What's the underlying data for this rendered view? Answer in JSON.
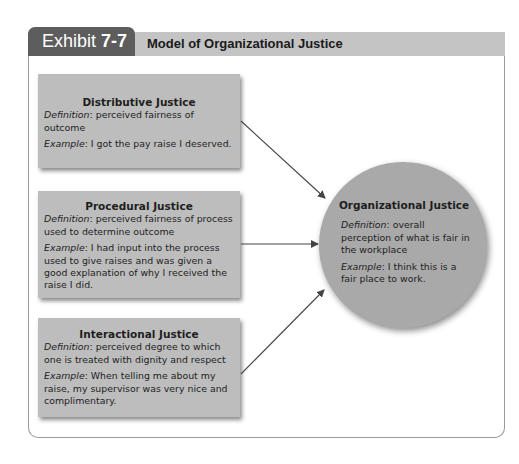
{
  "exhibit": {
    "label_prefix": "Exhibit ",
    "label_number": "7-7",
    "title": "Model of Organizational Justice"
  },
  "colors": {
    "tab": "#5d5d5d",
    "header_band": "#c4c4c4",
    "box_fill": "#bdbdbd",
    "circle_fill": "#a9a9a9",
    "arrow": "#444444"
  },
  "sources": [
    {
      "title": "Distributive Justice",
      "definition_label": "Definition",
      "definition": ": perceived fairness of outcome",
      "example_label": "Example",
      "example": ": I got the pay raise I deserved."
    },
    {
      "title": "Procedural Justice",
      "definition_label": "Definition",
      "definition": ": perceived fairness of process used to determine outcome",
      "example_label": "Example",
      "example": ": I had input into the process used to give raises and was given a good explanation of why I received the raise I did."
    },
    {
      "title": "Interactional Justice",
      "definition_label": "Definition",
      "definition": ": perceived degree to which one is treated with dignity and respect",
      "example_label": "Example",
      "example": ": When telling me about my raise, my supervisor was very nice and complimentary."
    }
  ],
  "target": {
    "title": "Organizational Justice",
    "definition_label": "Definition",
    "definition": ": overall perception of what is fair in the workplace",
    "example_label": "Example",
    "example": ": I think this is a fair place to work."
  },
  "edges": [
    {
      "from": "Distributive Justice",
      "to": "Organizational Justice"
    },
    {
      "from": "Procedural Justice",
      "to": "Organizational Justice"
    },
    {
      "from": "Interactional Justice",
      "to": "Organizational Justice"
    }
  ]
}
